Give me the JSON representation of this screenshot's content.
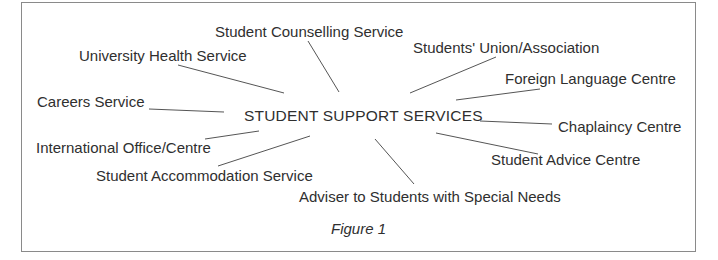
{
  "diagram": {
    "type": "spider-diagram",
    "center": {
      "label": "STUDENT SUPPORT SERVICES"
    },
    "nodes": [
      {
        "id": "counselling",
        "label": "Student Counselling Service"
      },
      {
        "id": "health",
        "label": "University Health Service"
      },
      {
        "id": "union",
        "label": "Students' Union/Association"
      },
      {
        "id": "foreign-language",
        "label": "Foreign Language Centre"
      },
      {
        "id": "careers",
        "label": "Careers Service"
      },
      {
        "id": "chaplaincy",
        "label": "Chaplaincy Centre"
      },
      {
        "id": "international",
        "label": "International Office/Centre"
      },
      {
        "id": "advice",
        "label": "Student Advice Centre"
      },
      {
        "id": "accommodation",
        "label": "Student Accommodation Service"
      },
      {
        "id": "special-needs",
        "label": "Adviser to Students with Special Needs"
      }
    ],
    "caption": "Figure 1"
  }
}
